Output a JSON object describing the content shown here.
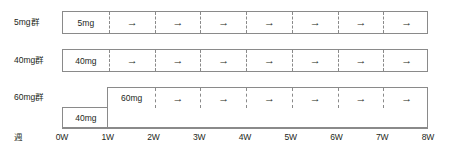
{
  "figure": {
    "kind": "dosing-schedule-diagram",
    "axis_caption": "週",
    "arrow_glyph": "→",
    "border_color": "#8a8a8a",
    "text_color": "#231f20",
    "background_color": "#ffffff"
  },
  "axis": {
    "ticks": [
      "0W",
      "1W",
      "2W",
      "3W",
      "4W",
      "5W",
      "6W",
      "7W",
      "8W"
    ],
    "start_week": 0,
    "end_week": 8,
    "week_count": 8
  },
  "groups": [
    {
      "label": "5mg群",
      "segments": [
        {
          "dose": "5mg",
          "start_week": 0,
          "end_week": 1,
          "level": "upper",
          "cells": [
            {
              "text": "5mg",
              "kind": "dose",
              "week": 0
            },
            {
              "text": "→",
              "kind": "arrow",
              "week": 1
            },
            {
              "text": "→",
              "kind": "arrow",
              "week": 2
            },
            {
              "text": "→",
              "kind": "arrow",
              "week": 3
            },
            {
              "text": "→",
              "kind": "arrow",
              "week": 4
            },
            {
              "text": "→",
              "kind": "arrow",
              "week": 5
            },
            {
              "text": "→",
              "kind": "arrow",
              "week": 6
            },
            {
              "text": "→",
              "kind": "arrow",
              "week": 7
            }
          ]
        }
      ]
    },
    {
      "label": "40mg群",
      "segments": [
        {
          "dose": "40mg",
          "start_week": 0,
          "end_week": 8,
          "level": "upper",
          "cells": [
            {
              "text": "40mg",
              "kind": "dose",
              "week": 0
            },
            {
              "text": "→",
              "kind": "arrow",
              "week": 1
            },
            {
              "text": "→",
              "kind": "arrow",
              "week": 2
            },
            {
              "text": "→",
              "kind": "arrow",
              "week": 3
            },
            {
              "text": "→",
              "kind": "arrow",
              "week": 4
            },
            {
              "text": "→",
              "kind": "arrow",
              "week": 5
            },
            {
              "text": "→",
              "kind": "arrow",
              "week": 6
            },
            {
              "text": "→",
              "kind": "arrow",
              "week": 7
            }
          ]
        }
      ]
    },
    {
      "label": "60mg群",
      "segments": [
        {
          "dose": "40mg",
          "start_week": 0,
          "end_week": 1,
          "level": "lower",
          "cells": [
            {
              "text": "40mg",
              "kind": "dose",
              "week": 0
            }
          ]
        },
        {
          "dose": "60mg",
          "start_week": 1,
          "end_week": 8,
          "level": "upper",
          "cells": [
            {
              "text": "60mg",
              "kind": "dose",
              "week": 1
            },
            {
              "text": "→",
              "kind": "arrow",
              "week": 2
            },
            {
              "text": "→",
              "kind": "arrow",
              "week": 3
            },
            {
              "text": "→",
              "kind": "arrow",
              "week": 4
            },
            {
              "text": "→",
              "kind": "arrow",
              "week": 5
            },
            {
              "text": "→",
              "kind": "arrow",
              "week": 6
            },
            {
              "text": "→",
              "kind": "arrow",
              "week": 7
            }
          ]
        }
      ]
    }
  ]
}
